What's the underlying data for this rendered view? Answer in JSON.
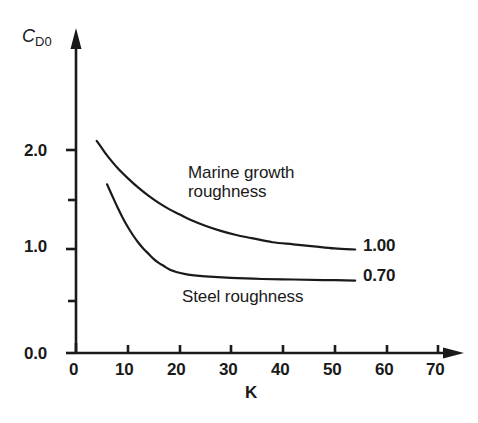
{
  "chart_data": {
    "type": "line",
    "title": "",
    "subtitle": "",
    "xlabel": "K",
    "ylabel": "C_D0",
    "ylabel_main": "C",
    "ylabel_sub": "D0",
    "xlim": [
      0,
      75
    ],
    "ylim": [
      0.0,
      2.5
    ],
    "grid": false,
    "legend_position": "inline-annotation",
    "x_ticks": [
      0,
      10,
      20,
      30,
      40,
      50,
      60,
      70
    ],
    "x_tick_labels": [
      "0",
      "10",
      "20",
      "30",
      "40",
      "50",
      "60",
      "70"
    ],
    "y_ticks": [
      0.0,
      0.5,
      1.0,
      1.5,
      2.0
    ],
    "y_tick_labels": [
      "0.0",
      "",
      "1.0",
      "",
      "2.0"
    ],
    "y_major_labels": [
      "0.0",
      "1.0",
      "2.0"
    ],
    "y_minor_ticks": [
      0.5,
      1.5
    ],
    "series": [
      {
        "name": "Marine growth roughness",
        "end_label": "1.00",
        "asymptote": 1.0,
        "x": [
          4,
          5,
          6,
          8,
          10,
          12,
          14,
          16,
          18,
          20,
          22,
          25,
          28,
          31,
          34,
          38,
          42,
          46,
          50,
          54
        ],
        "values": [
          2.05,
          1.98,
          1.91,
          1.79,
          1.69,
          1.6,
          1.52,
          1.45,
          1.39,
          1.34,
          1.29,
          1.23,
          1.18,
          1.14,
          1.11,
          1.07,
          1.05,
          1.03,
          1.01,
          1.0
        ]
      },
      {
        "name": "Steel roughness",
        "end_label": "0.70",
        "asymptote": 0.7,
        "x": [
          6,
          7,
          8,
          9,
          10,
          11,
          12,
          13,
          14,
          15,
          16,
          17,
          18,
          19,
          20,
          22,
          25,
          30,
          36,
          42,
          48,
          54
        ],
        "values": [
          1.63,
          1.52,
          1.41,
          1.31,
          1.22,
          1.14,
          1.07,
          1.01,
          0.96,
          0.91,
          0.87,
          0.84,
          0.81,
          0.79,
          0.775,
          0.755,
          0.74,
          0.725,
          0.715,
          0.71,
          0.705,
          0.7
        ]
      }
    ],
    "annotations": [
      {
        "name": "marine-growth-roughness-label",
        "text_line_1": "Marine growth",
        "text_line_2": "roughness"
      },
      {
        "name": "steel-roughness-label",
        "text": "Steel roughness"
      }
    ],
    "colors": {
      "background": "#ffffff",
      "axis": "#1a1a1a",
      "curve": "#1a1a1a",
      "text": "#1a1a1a"
    }
  },
  "labels": {
    "y_axis_title_main": "C",
    "y_axis_title_sub": "D0",
    "x_axis_title": "K",
    "y_tick_0": "0.0",
    "y_tick_1": "1.0",
    "y_tick_2": "2.0",
    "x_tick_0": "0",
    "x_tick_10": "10",
    "x_tick_20": "20",
    "x_tick_30": "30",
    "x_tick_40": "40",
    "x_tick_50": "50",
    "x_tick_60": "60",
    "x_tick_70": "70",
    "marine_line_1": "Marine growth",
    "marine_line_2": "roughness",
    "steel": "Steel roughness",
    "end_marine": "1.00",
    "end_steel": "0.70"
  }
}
